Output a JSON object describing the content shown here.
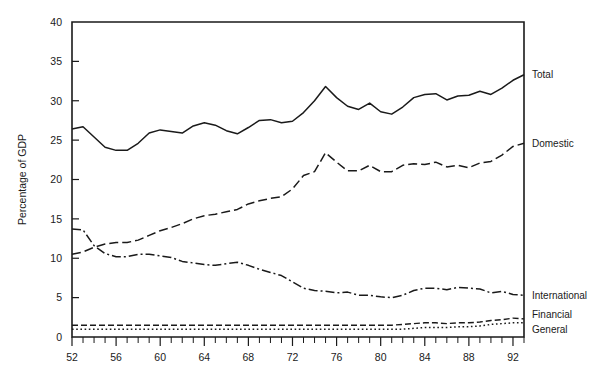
{
  "chart_data": {
    "type": "line",
    "title": "",
    "subtitle": "",
    "xlabel": "",
    "ylabel": "Percentage of GDP",
    "xlim": [
      52,
      93
    ],
    "ylim": [
      0,
      40
    ],
    "yticks": [
      0,
      5,
      10,
      15,
      20,
      25,
      30,
      35,
      40
    ],
    "xticks_labeled": [
      52,
      56,
      60,
      64,
      68,
      72,
      76,
      80,
      84,
      88,
      92
    ],
    "xticks_minor_step": 1,
    "grid": false,
    "legend_position": "right-inline",
    "x": [
      52,
      53,
      54,
      55,
      56,
      57,
      58,
      59,
      60,
      61,
      62,
      63,
      64,
      65,
      66,
      67,
      68,
      69,
      70,
      71,
      72,
      73,
      74,
      75,
      76,
      77,
      78,
      79,
      80,
      81,
      82,
      83,
      84,
      85,
      86,
      87,
      88,
      89,
      90,
      91,
      92,
      93
    ],
    "series": [
      {
        "name": "Total",
        "style": "solid",
        "label": "Total",
        "values": [
          26.4,
          26.7,
          25.4,
          24.1,
          23.7,
          23.7,
          24.6,
          25.9,
          26.3,
          26.1,
          25.9,
          26.8,
          27.2,
          26.9,
          26.2,
          25.8,
          26.6,
          27.5,
          27.6,
          27.2,
          27.4,
          28.5,
          30.0,
          31.8,
          30.4,
          29.3,
          28.9,
          29.7,
          28.6,
          28.3,
          29.2,
          30.4,
          30.8,
          30.9,
          30.1,
          30.6,
          30.7,
          31.2,
          30.8,
          31.6,
          32.6,
          33.3
        ]
      },
      {
        "name": "Domestic",
        "style": "dashed",
        "label": "Domestic",
        "values": [
          10.5,
          10.8,
          11.4,
          11.8,
          12.0,
          12.0,
          12.3,
          12.9,
          13.5,
          13.9,
          14.4,
          15.0,
          15.4,
          15.6,
          15.9,
          16.2,
          16.9,
          17.3,
          17.6,
          17.8,
          18.8,
          20.5,
          21.0,
          23.4,
          22.2,
          21.1,
          21.1,
          21.8,
          21.0,
          21.0,
          21.8,
          22.0,
          21.9,
          22.2,
          21.6,
          21.8,
          21.5,
          22.1,
          22.3,
          23.1,
          24.2,
          24.6
        ]
      },
      {
        "name": "International",
        "style": "dashdot",
        "label": "International",
        "values": [
          13.7,
          13.6,
          11.6,
          10.6,
          10.2,
          10.2,
          10.5,
          10.5,
          10.3,
          10.1,
          9.6,
          9.4,
          9.2,
          9.1,
          9.3,
          9.5,
          9.1,
          8.6,
          8.2,
          7.8,
          7.0,
          6.2,
          5.9,
          5.8,
          5.6,
          5.7,
          5.3,
          5.3,
          5.1,
          5.0,
          5.3,
          5.9,
          6.2,
          6.2,
          6.0,
          6.3,
          6.2,
          6.1,
          5.6,
          5.8,
          5.4,
          5.3
        ]
      },
      {
        "name": "Financial",
        "style": "dashed-short",
        "label": "Financial",
        "values": [
          1.5,
          1.5,
          1.5,
          1.5,
          1.5,
          1.5,
          1.5,
          1.5,
          1.5,
          1.5,
          1.5,
          1.5,
          1.5,
          1.5,
          1.5,
          1.5,
          1.5,
          1.5,
          1.5,
          1.5,
          1.5,
          1.5,
          1.5,
          1.5,
          1.5,
          1.5,
          1.5,
          1.5,
          1.5,
          1.5,
          1.6,
          1.7,
          1.8,
          1.8,
          1.7,
          1.8,
          1.8,
          1.9,
          2.1,
          2.2,
          2.4,
          2.3
        ]
      },
      {
        "name": "General",
        "style": "dotted",
        "label": "General",
        "values": [
          1.0,
          1.0,
          1.0,
          1.0,
          1.0,
          1.0,
          1.0,
          1.0,
          1.0,
          1.0,
          1.0,
          1.0,
          1.0,
          1.0,
          1.0,
          1.0,
          1.0,
          1.0,
          1.0,
          1.0,
          1.0,
          1.0,
          1.0,
          1.0,
          1.0,
          1.0,
          1.0,
          1.0,
          1.0,
          1.0,
          1.0,
          1.1,
          1.2,
          1.2,
          1.2,
          1.3,
          1.3,
          1.4,
          1.6,
          1.7,
          1.8,
          1.8
        ]
      }
    ],
    "colors": {
      "line": "#1a1a1a",
      "axis": "#1a1a1a",
      "background": "#ffffff"
    }
  }
}
